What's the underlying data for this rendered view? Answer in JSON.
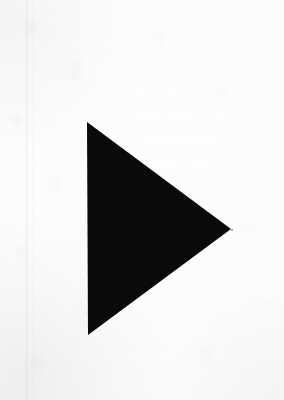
{
  "canvas": {
    "width": 284,
    "height": 400,
    "background_color": "#fcfcfc",
    "medium": "scanned paper"
  },
  "shape": {
    "name": "play-triangle",
    "semantic": "right-pointing solid triangle",
    "fill_color": "#0a0a0a",
    "orientation": "points right",
    "vertices": [
      {
        "label": "top-left apex",
        "x": 87,
        "y": 122
      },
      {
        "label": "right tip",
        "x": 231,
        "y": 229
      },
      {
        "label": "bottom-left base",
        "x": 88,
        "y": 335
      }
    ],
    "points_attr": "87,122 231,229 88,335",
    "bounding_box": {
      "x": 87,
      "y": 122,
      "width": 144,
      "height": 213
    }
  },
  "artifacts": {
    "scan_streak_x": 26,
    "vignette_corner": "bottom-left",
    "speck": {
      "x": 231,
      "y": 229
    }
  }
}
